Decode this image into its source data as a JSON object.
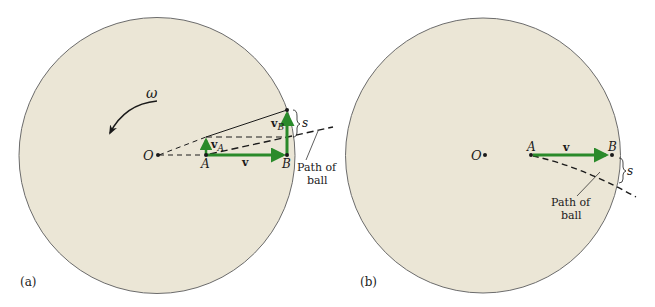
{
  "colors": {
    "disk_fill": "#ebe6d6",
    "disk_stroke": "#6b6b6b",
    "vector": "#2a8a2a",
    "ink": "#1a1a1a",
    "background": "#ffffff"
  },
  "panel_a": {
    "caption": "(a)",
    "omega": "ω",
    "point_O": "O",
    "point_A": "A",
    "point_B": "B",
    "vec_v": "v",
    "vec_vA_main": "v",
    "vec_vA_sub": "A",
    "vec_vB_main": "v",
    "vec_vB_sub": "B",
    "displacement": "s",
    "path_label_line1": "Path of",
    "path_label_line2": "ball"
  },
  "panel_b": {
    "caption": "(b)",
    "point_O": "O",
    "point_A": "A",
    "point_B": "B",
    "vec_v": "v",
    "displacement": "s",
    "path_label_line1": "Path of",
    "path_label_line2": "ball"
  }
}
